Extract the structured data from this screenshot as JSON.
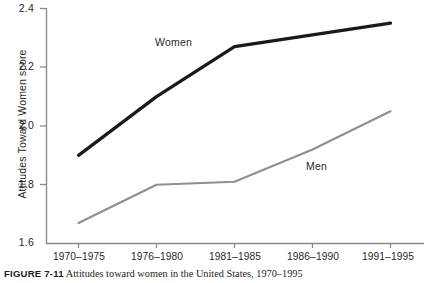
{
  "chart_data": {
    "type": "line",
    "title": "",
    "xlabel": "",
    "ylabel": "Attitudes Toward Women score",
    "categories": [
      "1970–1975",
      "1976–1980",
      "1981–1985",
      "1986–1990",
      "1991–1995"
    ],
    "ylim": [
      1.6,
      2.4
    ],
    "yticks": [
      "1.6",
      "1.8",
      "2.0",
      "2.2",
      "2.4"
    ],
    "ytick_values": [
      1.6,
      1.8,
      2.0,
      2.2,
      2.4
    ],
    "grid": false,
    "legend_position": "inline-annotations",
    "series": [
      {
        "name": "Women",
        "color": "#1a1a1a",
        "line_width": 3.2,
        "values": [
          1.9,
          2.1,
          2.27,
          2.31,
          2.35
        ]
      },
      {
        "name": "Men",
        "color": "#8f8f8f",
        "line_width": 2.1,
        "values": [
          1.67,
          1.8,
          1.81,
          1.92,
          2.05
        ]
      }
    ],
    "annotations": [
      {
        "text": "Women",
        "series": "Women"
      },
      {
        "text": "Men",
        "series": "Men"
      }
    ]
  },
  "axis": {
    "spine_color": "#8b8b8b",
    "y_title": "Attitudes Toward Women score",
    "y_ticks": [
      "2.4",
      "2.2",
      "2.0",
      "1.8",
      "1.6"
    ],
    "x_ticks": [
      "1970–1975",
      "1976–1980",
      "1981–1985",
      "1986–1990",
      "1991–1995"
    ]
  },
  "series_labels": {
    "women": "Women",
    "men": "Men"
  },
  "caption": {
    "figure_number": "FIGURE 7-11",
    "text": "Attitudes toward women in the United States, 1970–1995"
  }
}
